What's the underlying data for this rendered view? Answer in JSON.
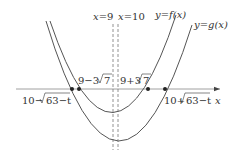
{
  "diagram": {
    "type": "function-graph",
    "axis": {
      "x_label": "x"
    },
    "curves": [
      {
        "id": "f",
        "label": "y=f(x)",
        "vertex_x": "9"
      },
      {
        "id": "g",
        "label": "y=g(x)",
        "vertex_x": "10"
      }
    ],
    "vertical_lines": [
      {
        "label": "x=9"
      },
      {
        "label": "x=10"
      }
    ],
    "roots": {
      "f_left": "9−3√7",
      "f_right": "9+3√7",
      "g_left": "10−√63−t",
      "g_right": "10+√63−t"
    },
    "text": {
      "x9": "x=9",
      "x10": "x=10",
      "yf": "y=f(x)",
      "yg": "y=g(x)",
      "f_left_a": "9−3",
      "f_left_b": "7",
      "f_right_a": "9+3",
      "f_right_b": "7",
      "g_left_a": "10−",
      "g_left_b": "63−t",
      "g_right_a": "10+",
      "g_right_b": "63−t",
      "axis_x": "x"
    },
    "colors": {
      "stroke": "#555555",
      "text": "#333333"
    }
  }
}
